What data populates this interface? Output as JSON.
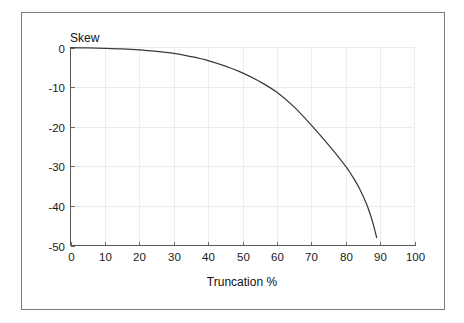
{
  "figure": {
    "background_color": "#ffffff",
    "frame_color": "#7b7b7b"
  },
  "chart_data": {
    "type": "line",
    "title": "",
    "subtitle": "",
    "xlabel": "Truncation %",
    "ylabel": "Skew",
    "xlim": [
      0,
      100
    ],
    "ylim": [
      -50,
      0
    ],
    "xticks": [
      "0",
      "10",
      "20",
      "30",
      "40",
      "50",
      "60",
      "70",
      "80",
      "90",
      "100"
    ],
    "xtick_values": [
      0,
      10,
      20,
      30,
      40,
      50,
      60,
      70,
      80,
      90,
      100
    ],
    "yticks": [
      "0",
      "-10",
      "-20",
      "-30",
      "-40",
      "-50"
    ],
    "ytick_values": [
      0,
      -10,
      -20,
      -30,
      -40,
      -50
    ],
    "grid": true,
    "grid_color": "#ececec",
    "legend": false,
    "legend_position": "none",
    "line_color": "#3a3a3a",
    "series": [
      {
        "name": "Skew vs Truncation",
        "x": [
          0,
          5,
          10,
          15,
          20,
          25,
          30,
          35,
          40,
          45,
          50,
          55,
          60,
          65,
          70,
          75,
          80,
          82,
          84,
          86,
          87,
          88,
          89
        ],
        "values": [
          -0.05,
          -0.1,
          -0.2,
          -0.35,
          -0.6,
          -1.0,
          -1.5,
          -2.3,
          -3.3,
          -4.7,
          -6.4,
          -8.6,
          -11.3,
          -15.0,
          -19.6,
          -24.6,
          -30.0,
          -32.6,
          -35.6,
          -39.4,
          -41.8,
          -44.6,
          -48.0
        ]
      }
    ],
    "annotations": []
  }
}
